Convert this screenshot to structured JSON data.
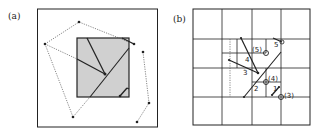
{
  "panels": [
    {
      "label": "(a)",
      "description": "Polygons overlapping a shaded rectangle"
    },
    {
      "label": "(b)",
      "description": "Grid subdivision with numbered segments and intersection markers",
      "segment_labels": [
        "1",
        "2",
        "3",
        "4",
        "5"
      ],
      "marker_labels": [
        "(3)",
        "(4)",
        "(5)"
      ]
    }
  ],
  "colors": {
    "line": "#222222",
    "dotted": "#555555",
    "shade": "#d0d0d0",
    "background": "#ffffff"
  }
}
